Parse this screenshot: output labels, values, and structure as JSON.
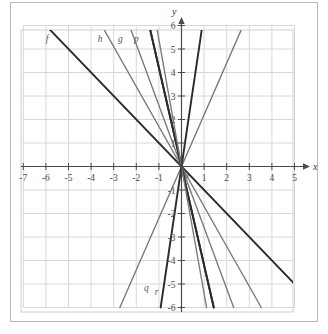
{
  "figure": {
    "background_color": "#ffffff",
    "frame_color": "#b9b9b9",
    "grid_color": "#d8d8d8",
    "axis_color": "#4a4a4a",
    "dark_line_color": "#2b2b2b",
    "gray_line_color": "#7a7a7a"
  },
  "axes": {
    "x_axis_label": "x",
    "y_axis_label": "y",
    "origin_label": "0",
    "x_ticks": [
      "-7",
      "-6",
      "-5",
      "-4",
      "-3",
      "-2",
      "-1",
      "1",
      "2",
      "3",
      "4",
      "5"
    ],
    "y_ticks": [
      "6",
      "5",
      "4",
      "3",
      "2",
      "1",
      "-1",
      "-2",
      "-3",
      "-4",
      "-5",
      "-6"
    ],
    "x_min": -7,
    "x_max": 5,
    "y_min": -6,
    "y_max": 6
  },
  "chart_data": {
    "type": "line",
    "title": "",
    "xlabel": "x",
    "ylabel": "y",
    "xlim": [
      -7,
      5
    ],
    "ylim": [
      -6,
      6
    ],
    "grid": true,
    "legend_position": "inline-labels",
    "series": [
      {
        "name": "f",
        "label": "f",
        "slope": -1,
        "intercept": 0,
        "color": "#2b2b2b",
        "label_x": -5.95,
        "label_y": 5.3
      },
      {
        "name": "h",
        "label": "h",
        "slope": -1.7,
        "intercept": 0,
        "color": "#7a7a7a",
        "label_x": -3.6,
        "label_y": 5.3
      },
      {
        "name": "g",
        "label": "g",
        "slope": -2.6,
        "intercept": 0,
        "color": "#7a7a7a",
        "label_x": -2.7,
        "label_y": 5.3
      },
      {
        "name": "p",
        "label": "p",
        "slope": -4.2,
        "intercept": 0,
        "color": "#2b2b2b",
        "label_x": -2.0,
        "label_y": 5.3
      },
      {
        "name": "s1",
        "label": "",
        "slope": 1.2,
        "intercept": 0,
        "color": "#2b2b2b",
        "label_x": null,
        "label_y": null
      },
      {
        "name": "s2",
        "label": "",
        "slope": 2.2,
        "intercept": 0,
        "color": "#7a7a7a",
        "label_x": null,
        "label_y": null
      },
      {
        "name": "s3",
        "label": "",
        "slope": 6.5,
        "intercept": 0,
        "color": "#2b2b2b",
        "label_x": null,
        "label_y": null
      },
      {
        "name": "q",
        "label": "q",
        "slope": -4.2,
        "intercept": 0,
        "color": "#2b2b2b",
        "label_x": -1.55,
        "label_y": -5.3
      },
      {
        "name": "r",
        "label": "r",
        "slope": -5.4,
        "intercept": 0,
        "color": "#7a7a7a",
        "label_x": -1.1,
        "label_y": -5.45
      }
    ]
  }
}
